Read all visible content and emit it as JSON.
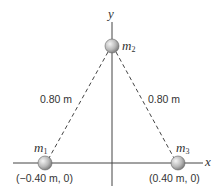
{
  "axes": {
    "x_label": "x",
    "y_label": "y"
  },
  "masses": [
    {
      "name": "m",
      "sub": "1",
      "coord": "(−0.40 m, 0)"
    },
    {
      "name": "m",
      "sub": "2"
    },
    {
      "name": "m",
      "sub": "3",
      "coord": "(0.40 m, 0)"
    }
  ],
  "distances": {
    "left": "0.80 m",
    "right": "0.80 m"
  },
  "colors": {
    "line": "#444444",
    "ball_light": "#f0f0f0",
    "ball_dark": "#8a8a8a"
  }
}
